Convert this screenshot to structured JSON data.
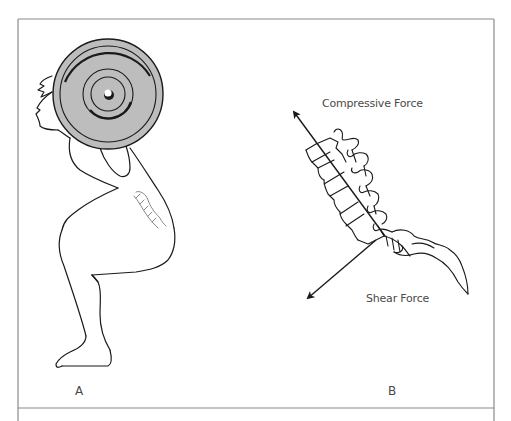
{
  "figure": {
    "panels": [
      {
        "id": "A",
        "label": "A",
        "description": "Person performing a back squat with barbell plate on shoulders; lumbar spine sketched on lower back"
      },
      {
        "id": "B",
        "label": "B",
        "description": "Lumbar spine and sacrum with force vectors"
      }
    ],
    "forces": {
      "compressive": {
        "label": "Compressive Force"
      },
      "shear": {
        "label": "Shear Force"
      }
    },
    "colors": {
      "line": "#1a1a1a",
      "frame": "#8a8a8a",
      "plate_fill": "#bdbdbd",
      "text": "#4a4a4a",
      "background": "#ffffff"
    }
  }
}
